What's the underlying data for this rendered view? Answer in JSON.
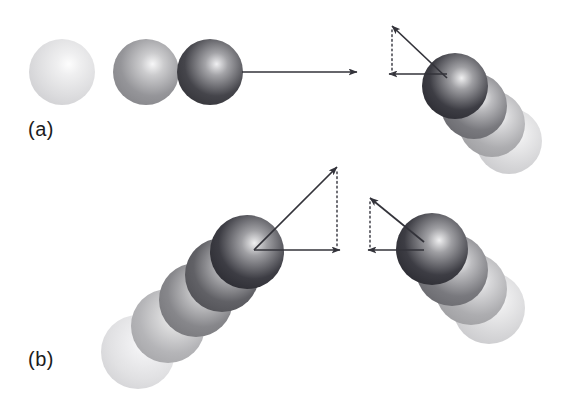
{
  "figure": {
    "background_color": "#ffffff",
    "width": 573,
    "height": 404,
    "vector_color": "#33333a",
    "dotted_color": "#4a4a52",
    "sphere_dark_color": "#3a3a42",
    "sphere_light_color": "#f0f0f0"
  },
  "panels": [
    {
      "id": "a",
      "label": "(a)",
      "label_x": 28,
      "label_y": 118,
      "description": "Ball moving horizontally, rebounding upward and backward",
      "incoming_sequence": {
        "name": "horizontal-approach-sequence",
        "count": 3,
        "radius": 33,
        "balls": [
          {
            "cx": 62,
            "cy": 72,
            "shade": 0.12
          },
          {
            "cx": 146,
            "cy": 72,
            "shade": 0.48
          },
          {
            "cx": 210,
            "cy": 72,
            "shade": 0.88
          }
        ]
      },
      "outgoing_sequence": {
        "name": "rebound-sequence",
        "count": 4,
        "radius": 33,
        "balls": [
          {
            "cx": 455,
            "cy": 86,
            "shade": 0.92
          },
          {
            "cx": 474,
            "cy": 106,
            "shade": 0.62
          },
          {
            "cx": 492,
            "cy": 124,
            "shade": 0.36
          },
          {
            "cx": 509,
            "cy": 141,
            "shade": 0.15
          }
        ]
      },
      "vectors": [
        {
          "name": "incoming-velocity-arrow",
          "type": "solid",
          "x1": 242,
          "y1": 72,
          "x2": 357,
          "y2": 72
        },
        {
          "name": "rebound-velocity-arrow",
          "type": "solid",
          "x1": 447,
          "y1": 78,
          "x2": 392,
          "y2": 26
        },
        {
          "name": "rebound-horizontal-component-arrow",
          "type": "solid",
          "x1": 447,
          "y1": 74,
          "x2": 389,
          "y2": 74
        },
        {
          "name": "rebound-vertical-component-dotted",
          "type": "dotted",
          "x1": 392,
          "y1": 30,
          "x2": 392,
          "y2": 74
        }
      ]
    },
    {
      "id": "b",
      "label": "(b)",
      "label_x": 28,
      "label_y": 348,
      "description": "Ball approaching at an angle, rebounding upward and backward",
      "incoming_sequence": {
        "name": "angled-approach-sequence",
        "count": 5,
        "radius": 37,
        "balls": [
          {
            "cx": 138,
            "cy": 352,
            "shade": 0.1
          },
          {
            "cx": 168,
            "cy": 326,
            "shade": 0.32
          },
          {
            "cx": 196,
            "cy": 300,
            "shade": 0.55
          },
          {
            "cx": 222,
            "cy": 275,
            "shade": 0.74
          },
          {
            "cx": 247,
            "cy": 252,
            "shade": 0.92
          }
        ]
      },
      "outgoing_sequence": {
        "name": "rebound-sequence",
        "count": 4,
        "radius": 36,
        "balls": [
          {
            "cx": 432,
            "cy": 249,
            "shade": 0.92
          },
          {
            "cx": 452,
            "cy": 270,
            "shade": 0.62
          },
          {
            "cx": 471,
            "cy": 289,
            "shade": 0.36
          },
          {
            "cx": 489,
            "cy": 308,
            "shade": 0.15
          }
        ]
      },
      "vectors": [
        {
          "name": "incoming-velocity-arrow",
          "type": "solid",
          "x1": 254,
          "y1": 250,
          "x2": 337,
          "y2": 167
        },
        {
          "name": "incoming-horizontal-component-arrow",
          "type": "solid",
          "x1": 254,
          "y1": 250,
          "x2": 340,
          "y2": 250
        },
        {
          "name": "incoming-vertical-component-dotted",
          "type": "dotted",
          "x1": 337,
          "y1": 172,
          "x2": 337,
          "y2": 248
        },
        {
          "name": "rebound-velocity-arrow",
          "type": "solid",
          "x1": 424,
          "y1": 242,
          "x2": 370,
          "y2": 198
        },
        {
          "name": "rebound-horizontal-component-arrow",
          "type": "solid",
          "x1": 424,
          "y1": 250,
          "x2": 368,
          "y2": 250
        },
        {
          "name": "rebound-vertical-component-dotted",
          "type": "dotted",
          "x1": 370,
          "y1": 202,
          "x2": 370,
          "y2": 250
        }
      ]
    }
  ]
}
